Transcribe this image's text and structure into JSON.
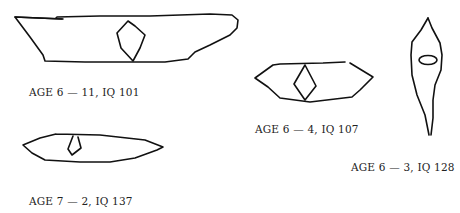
{
  "figures": [
    {
      "id": "drawing-1",
      "caption": "AGE 6 — 11, IQ 101",
      "shape": "long irregular outline with diamond inside"
    },
    {
      "id": "drawing-2",
      "caption": "AGE 6 — 4, IQ 107",
      "shape": "hexagonal outline with diamond inside"
    },
    {
      "id": "drawing-3",
      "caption": "AGE 6 — 3, IQ 128",
      "shape": "vertical elongated outline with small oval inside"
    },
    {
      "id": "drawing-4",
      "caption": "AGE 7 — 2, IQ 137",
      "shape": "flat elongated hexagon with small diamond inside"
    }
  ]
}
